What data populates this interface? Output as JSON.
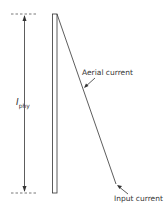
{
  "diagram": {
    "dimension_label": {
      "symbol": "I",
      "subscript": "phy"
    },
    "labels": {
      "aerial_current": "Aerial current",
      "input_current": "Input current"
    },
    "colors": {
      "line": "#333333",
      "background": "#ffffff"
    }
  }
}
